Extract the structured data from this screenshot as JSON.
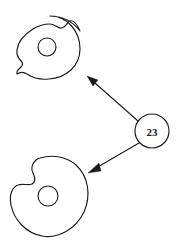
{
  "figure": {
    "title": "",
    "background_color": "#ffffff",
    "stroke_color": "#1a1a1a"
  },
  "nodes": [
    {
      "id": "label-node",
      "label": "23",
      "shape": "circle",
      "center": [
        152,
        131
      ],
      "radius": 17
    }
  ],
  "shapes": [
    {
      "id": "blob-top",
      "name": "notched-disc-top",
      "center": [
        48,
        47
      ],
      "radius": 32,
      "hole_radius": 9,
      "notches": 2
    },
    {
      "id": "blob-bottom",
      "name": "notched-disc-bottom",
      "center": [
        48,
        196
      ],
      "radius": 40,
      "hole_radius": 10,
      "notches": 2
    }
  ],
  "edges": [
    {
      "id": "edge-to-top",
      "from": "label-node",
      "to": "blob-top",
      "arrow": "to",
      "start": [
        138,
        121
      ],
      "end": [
        88,
        77
      ]
    },
    {
      "id": "edge-to-bottom",
      "from": "label-node",
      "to": "blob-bottom",
      "arrow": "to",
      "start": [
        139,
        143
      ],
      "end": [
        89,
        172
      ]
    }
  ]
}
